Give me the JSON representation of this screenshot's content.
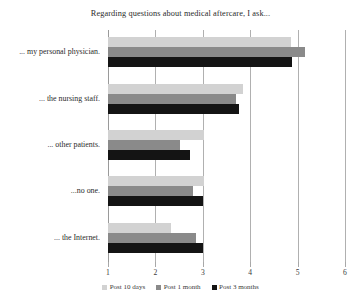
{
  "chart_data": {
    "type": "bar",
    "orientation": "horizontal",
    "title": "Regarding questions about medical aftercare, I ask...",
    "xlabel": "",
    "ylabel": "",
    "xlim": [
      1,
      6
    ],
    "xticks": [
      1,
      2,
      3,
      4,
      5,
      6
    ],
    "grid": true,
    "legend_position": "bottom",
    "categories": [
      "... my personal physician.",
      "... the nursing staff.",
      "... other patients.",
      "...no one.",
      "... the Internet."
    ],
    "series": [
      {
        "name": "Post 10 days",
        "color": "#d2d2d2",
        "values": [
          4.86,
          3.85,
          3.02,
          3.02,
          2.33
        ]
      },
      {
        "name": "Post 1 month",
        "color": "#8a8a8a",
        "values": [
          5.16,
          3.7,
          2.52,
          2.8,
          2.86
        ]
      },
      {
        "name": "Post 3 months",
        "color": "#141414",
        "values": [
          4.88,
          3.77,
          2.73,
          3.0,
          3.0
        ]
      }
    ]
  }
}
